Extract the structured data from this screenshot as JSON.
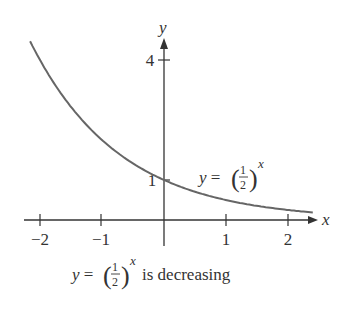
{
  "chart_data": {
    "type": "line",
    "title": "",
    "function": "y = (1/2)^x",
    "xlabel": "x",
    "ylabel": "y",
    "xlim": [
      -2.16,
      2.4
    ],
    "ylim": [
      0,
      4.5
    ],
    "x_ticks": [
      -2,
      -1,
      1,
      2
    ],
    "x_tick_labels": [
      "−2",
      "−1",
      "1",
      "2"
    ],
    "y_ticks": [
      1,
      4
    ],
    "y_tick_labels": [
      "1",
      "4"
    ],
    "grid": false,
    "series": [
      {
        "name": "y = (1/2)^x",
        "x": [
          -2.16,
          -2,
          -1.5,
          -1,
          -0.5,
          0,
          0.5,
          1,
          1.5,
          2,
          2.4
        ],
        "y": [
          4.47,
          4,
          2.83,
          2,
          1.41,
          1,
          0.71,
          0.5,
          0.35,
          0.25,
          0.19
        ]
      }
    ],
    "annotations": [
      {
        "text": "y = (1/2)^x",
        "position": "right of curve near x=1"
      },
      {
        "text": "y = (1/2)^x is decreasing",
        "position": "caption below axis"
      }
    ]
  },
  "labels": {
    "x_axis": "x",
    "y_axis": "y",
    "curve_label_lhs": "y = ",
    "frac_num": "1",
    "frac_den": "2",
    "exp": "x",
    "caption_suffix": "is decreasing"
  }
}
